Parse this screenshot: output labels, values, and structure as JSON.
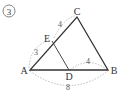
{
  "problem_number": "③",
  "points": {
    "A": {
      "label": "A",
      "x": 30,
      "y": 70
    },
    "B": {
      "label": "B",
      "x": 108,
      "y": 70
    },
    "C": {
      "label": "C",
      "x": 77,
      "y": 17
    },
    "D": {
      "label": "D",
      "x": 69,
      "y": 70
    },
    "E": {
      "label": "E",
      "x": 52,
      "y": 41
    }
  },
  "measurements": {
    "AE": "3",
    "EC": "4",
    "DB": "4",
    "AB": "8"
  },
  "colors": {
    "line": "#333333",
    "dashed": "#aaaaaa",
    "text": "#333333"
  }
}
